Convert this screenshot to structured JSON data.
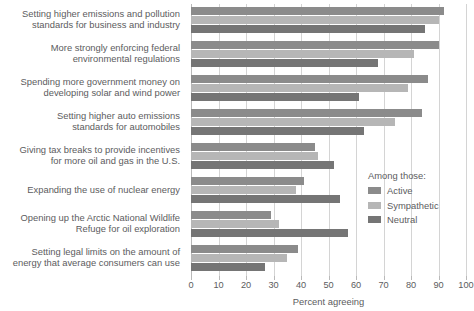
{
  "chart_data": {
    "type": "bar",
    "orientation": "horizontal",
    "title": "",
    "xlabel": "Percent agreeing",
    "ylabel": "",
    "xlim": [
      0,
      100
    ],
    "xticks": [
      0,
      10,
      20,
      30,
      40,
      50,
      60,
      70,
      80,
      90,
      100
    ],
    "grid": true,
    "legend_title": "Among those:",
    "legend_position": "right-middle",
    "categories": [
      "Setting higher emissions and pollution\nstandards for business and industry",
      "More strongly enforcing federal\nenvironmental regulations",
      "Spending more government money on\ndeveloping solar and wind power",
      "Setting higher auto emissions\nstandards for automobiles",
      "Giving tax breaks to provide incentives\nfor more oil and gas in the U.S.",
      "Expanding the use of nuclear energy",
      "Opening up the Arctic National Wildlife\nRefuge for oil exploration",
      "Setting legal limits on the amount of\nenergy that average consumers can use"
    ],
    "series": [
      {
        "name": "Active",
        "color": "#8b8b8b",
        "values": [
          92,
          90,
          86,
          84,
          45,
          41,
          29,
          39
        ]
      },
      {
        "name": "Sympathetic",
        "color": "#b6b6b6",
        "values": [
          90,
          81,
          79,
          74,
          46,
          38,
          32,
          35
        ]
      },
      {
        "name": "Neutral",
        "color": "#757575",
        "values": [
          85,
          68,
          61,
          63,
          52,
          54,
          57,
          27
        ]
      }
    ]
  },
  "axis": {
    "x_title": "Percent agreeing",
    "tick_labels": [
      "0",
      "10",
      "20",
      "30",
      "40",
      "50",
      "60",
      "70",
      "80",
      "90",
      "100"
    ]
  },
  "legend": {
    "title": "Among those:",
    "items": [
      {
        "label": "Active",
        "color": "#8b8b8b"
      },
      {
        "label": "Sympathetic",
        "color": "#b6b6b6"
      },
      {
        "label": "Neutral",
        "color": "#757575"
      }
    ]
  }
}
